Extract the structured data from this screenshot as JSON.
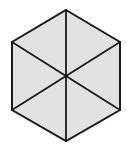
{
  "figure": {
    "name": "hexagon-six-triangles",
    "canvas": {
      "width": 126,
      "height": 150,
      "background_color": "#ffffff"
    },
    "style": {
      "fill_color": "#e2e2e2",
      "stroke_color": "#1a1a1a",
      "outer_stroke_width": 2,
      "inner_stroke_width": 1.8,
      "orientation": "pointy-top"
    },
    "center": {
      "x": 66,
      "y": 75.5,
      "label": "center"
    },
    "vertices": [
      {
        "id": "top",
        "x": 66,
        "y": 10
      },
      {
        "id": "upper-right",
        "x": 120,
        "y": 42
      },
      {
        "id": "lower-right",
        "x": 120,
        "y": 110
      },
      {
        "id": "bottom",
        "x": 66,
        "y": 141
      },
      {
        "id": "lower-left",
        "x": 12,
        "y": 110
      },
      {
        "id": "upper-left",
        "x": 12,
        "y": 42
      }
    ],
    "outline_points": "66,10 120,42 120,110 66,141 12,110 12,42",
    "diagonals": [
      {
        "id": "vertical-diagonal",
        "from": "top",
        "to": "bottom",
        "x1": 66,
        "y1": 10,
        "x2": 66,
        "y2": 141
      },
      {
        "id": "upperleft-lowerright",
        "from": "upper-left",
        "to": "lower-right",
        "x1": 12,
        "y1": 42,
        "x2": 120,
        "y2": 110
      },
      {
        "id": "upperright-lowerleft",
        "from": "upper-right",
        "to": "lower-left",
        "x1": 120,
        "y1": 42,
        "x2": 12,
        "y2": 110
      }
    ],
    "triangles": [
      {
        "id": "triangle-top-left",
        "points": "66,10 66,75.5 12,42"
      },
      {
        "id": "triangle-top-right",
        "points": "66,10 120,42 66,75.5"
      },
      {
        "id": "triangle-right",
        "points": "120,42 120,110 66,75.5"
      },
      {
        "id": "triangle-bottom-right",
        "points": "66,75.5 120,110 66,141"
      },
      {
        "id": "triangle-bottom-left",
        "points": "66,75.5 66,141 12,110"
      },
      {
        "id": "triangle-left",
        "points": "12,42 66,75.5 12,110"
      }
    ]
  }
}
